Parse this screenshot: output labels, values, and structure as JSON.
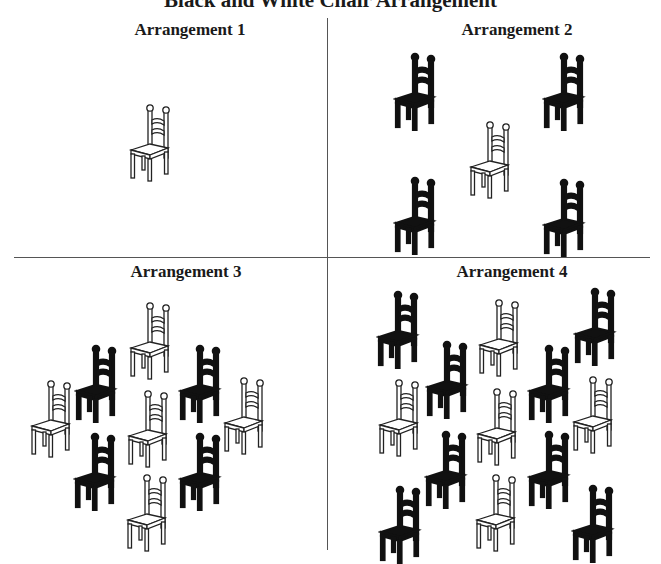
{
  "figure": {
    "title": "Black and White Chair Arrangement",
    "colors": {
      "black_chair": "#111111",
      "white_chair": "#ffffff",
      "outline": "#222222",
      "divider": "#555555"
    },
    "panels": [
      {
        "label": "Arrangement 1",
        "chairs": [
          {
            "color": "white",
            "x": 128,
            "y": 102
          }
        ]
      },
      {
        "label": "Arrangement 2",
        "chairs": [
          {
            "color": "black",
            "x": 393,
            "y": 51
          },
          {
            "color": "black",
            "x": 542,
            "y": 51
          },
          {
            "color": "white",
            "x": 468,
            "y": 119
          },
          {
            "color": "black",
            "x": 393,
            "y": 175
          },
          {
            "color": "black",
            "x": 542,
            "y": 177
          }
        ]
      },
      {
        "label": "Arrangement 3",
        "chairs": [
          {
            "color": "white",
            "x": 128,
            "y": 300
          },
          {
            "color": "black",
            "x": 74,
            "y": 343
          },
          {
            "color": "black",
            "x": 178,
            "y": 343
          },
          {
            "color": "white",
            "x": 29,
            "y": 378
          },
          {
            "color": "white",
            "x": 126,
            "y": 388
          },
          {
            "color": "white",
            "x": 222,
            "y": 375
          },
          {
            "color": "black",
            "x": 73,
            "y": 431
          },
          {
            "color": "black",
            "x": 178,
            "y": 431
          },
          {
            "color": "white",
            "x": 125,
            "y": 472
          }
        ]
      },
      {
        "label": "Arrangement 4",
        "chairs": [
          {
            "color": "black",
            "x": 376,
            "y": 289
          },
          {
            "color": "white",
            "x": 477,
            "y": 297
          },
          {
            "color": "black",
            "x": 573,
            "y": 286
          },
          {
            "color": "black",
            "x": 425,
            "y": 339
          },
          {
            "color": "black",
            "x": 527,
            "y": 343
          },
          {
            "color": "white",
            "x": 377,
            "y": 377
          },
          {
            "color": "white",
            "x": 475,
            "y": 386
          },
          {
            "color": "white",
            "x": 571,
            "y": 374
          },
          {
            "color": "black",
            "x": 424,
            "y": 429
          },
          {
            "color": "black",
            "x": 527,
            "y": 429
          },
          {
            "color": "black",
            "x": 378,
            "y": 484
          },
          {
            "color": "white",
            "x": 474,
            "y": 472
          },
          {
            "color": "black",
            "x": 571,
            "y": 483
          }
        ]
      }
    ]
  }
}
